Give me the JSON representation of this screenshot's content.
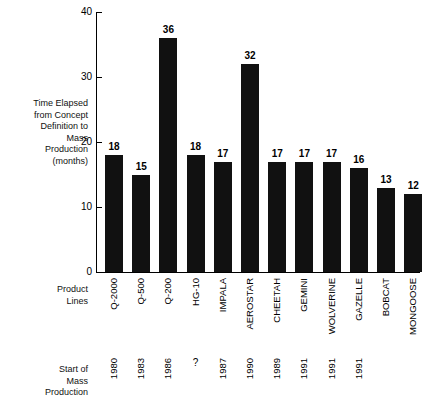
{
  "labels": {
    "y_axis_caption": "Time Elapsed\nfrom Concept\nDefinition to\nMass\nProduction\n(months)",
    "product_lines_caption": "Product\nLines",
    "start_of_mass_production_caption": "Start of\nMass\nProduction"
  },
  "chart_data": {
    "type": "bar",
    "title": "",
    "xlabel": "Product Lines",
    "ylabel": "Time Elapsed from Concept Definition to Mass Production (months)",
    "ylim": [
      0,
      40
    ],
    "yticks": [
      0,
      10,
      20,
      30,
      40
    ],
    "grid": false,
    "legend": null,
    "bar_color": "#111111",
    "categories": [
      "Q-2000",
      "Q-500",
      "Q-200",
      "HG-10",
      "IMPALA",
      "AEROSTAR",
      "CHEETAH",
      "GEMINI",
      "WOLVERINE",
      "GAZELLE",
      "BOBCAT",
      "MONGOOSE"
    ],
    "values": [
      18,
      15,
      36,
      18,
      17,
      32,
      17,
      17,
      17,
      16,
      13,
      12
    ],
    "data_labels": [
      "18",
      "15",
      "36",
      "18",
      "17",
      "32",
      "17",
      "17",
      "17",
      "16",
      "13",
      "12"
    ],
    "secondary_axis_label": "Start of Mass Production",
    "start_of_mass_production": [
      "1980",
      "1983",
      "1986",
      "?",
      "1987",
      "1990",
      "1989",
      "1991",
      "1991",
      "1991",
      "",
      ""
    ]
  }
}
